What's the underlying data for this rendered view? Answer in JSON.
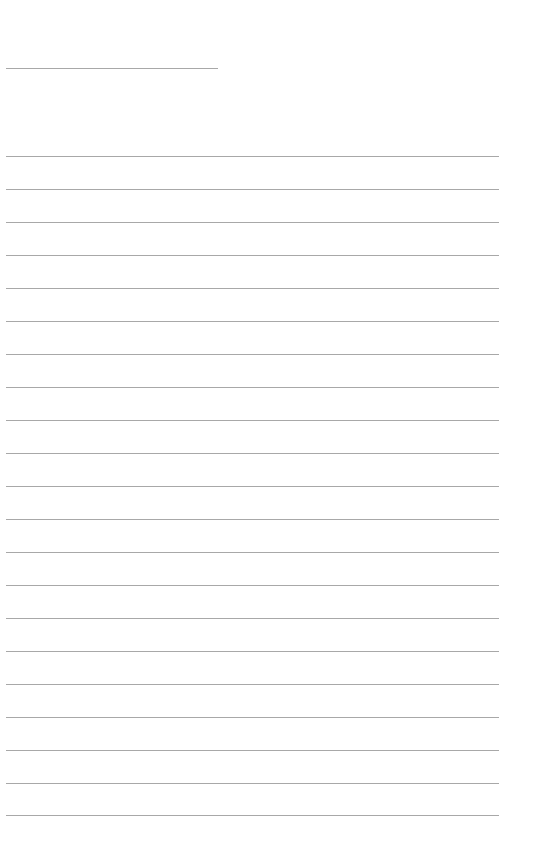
{
  "page": {
    "type": "lined-paper",
    "header_line": {
      "x1": 6,
      "x2": 218,
      "y": 68
    },
    "lines": {
      "x1": 6,
      "x2": 499,
      "y_positions": [
        156,
        189,
        222,
        255,
        288,
        321,
        354,
        387,
        420,
        453,
        486,
        519,
        552,
        585,
        618,
        651,
        684,
        717,
        750,
        783,
        815
      ]
    },
    "line_color": "#a8a8a8"
  }
}
